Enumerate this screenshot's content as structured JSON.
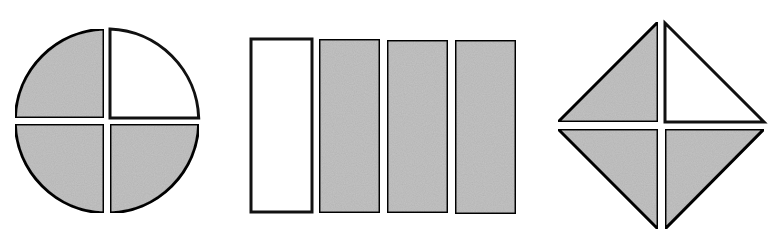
{
  "figure": {
    "colors": {
      "shaded": "#c4c4c4",
      "unshaded": "#ffffff",
      "stroke": "#111111"
    },
    "shapes": [
      {
        "name": "circle",
        "parts": 4,
        "shaded_parts": 3,
        "parts_state": [
          "shaded",
          "unshaded",
          "shaded",
          "shaded"
        ]
      },
      {
        "name": "rectangle",
        "parts": 4,
        "shaded_parts": 3,
        "parts_state": [
          "unshaded",
          "shaded",
          "shaded",
          "shaded"
        ]
      },
      {
        "name": "diamond",
        "parts": 4,
        "shaded_parts": 3,
        "parts_state": [
          "shaded",
          "unshaded",
          "shaded",
          "shaded"
        ]
      }
    ]
  }
}
